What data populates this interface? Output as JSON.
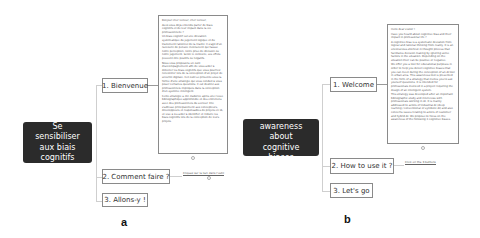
{
  "panels": [
    {
      "id": "a",
      "caption": "a",
      "root": {
        "lines": [
          "Se sensibiliser",
          "aux biais",
          "cognitifs"
        ]
      },
      "topics": [
        {
          "label": "1. Bienvenue"
        },
        {
          "label": "2. Comment faire ?"
        },
        {
          "label": "3. Allons-y !"
        }
      ],
      "note": {
        "paragraphs": [
          "Bonjour cher lecteur, cher lecteur,",
          "Avez-vous déjà entendu parler de biais cognitifs et de leur impact dans la vie professionnelle ?",
          "Un biais cognitif est une déviation systématique du jugement logique et du traitement rationnel de la réalité. Il s'agit d'un raccourci de pensée inconscient qui fausse notre perception, notre prise de décision ou notre jugement. Selon le contexte, ses effets peuvent être positifs ou négatifs.",
          "Nous vous proposons un outil d'accompagnement afin de vous aider à détecter les biais cognitifs que vous pourriez rencontrer lors de la conception d'un projet de sécurité digitale. Cet outil se présente sous la forme d'une stratégie qui vous conduit à vous poser certaines questions. Il est destiné aux professionnels impliqués dans la conception d'un système intelligent.",
          "Cette stratégie a été élaborée après une revue bibliographique approfondie et des entretiens avec des professionnels du secteur. Elle s'adresse principalement aux concepteurs, développeurs et responsables de projets en IA, et vise à les aider à identifier et réduire les biais cognitifs lors de la conception de leurs projets."
        ]
      },
      "link_label": "Cliquez sur le lien dans l'outil"
    },
    {
      "id": "b",
      "caption": "b",
      "root": {
        "lines": [
          "To raise awareness",
          "about cognitive",
          "biases"
        ]
      },
      "topics": [
        {
          "label": "1. Welcome"
        },
        {
          "label": "2. How to use it ?"
        },
        {
          "label": "3. Let's go"
        }
      ],
      "note": {
        "paragraphs": [
          "Hello dear visitor !",
          "Have you heard about cognitive bias and their impact in professional life ?",
          "A cognitive bias is a systematic deviation from logical and rational thinking from reality. It is an unconscious shortcut in thought process that facilitates decision making by ignoring some factors in the situation. Depending on the situation their can be positive or negative.",
          "We offer you a tool for educational purposes in order to help you detect cognitive biases that you can meet during the conception of an AI tool in urban area. This awareness tool is presented in the form of a strategy that invites you to ask yourself questions. It is intended for professionals involved in a project requiring the design of an intelligent system.",
          "This strategy was developed after an important bibliographic study and interviews with professionals working in AI. It is mainly addressed to actors of industrial AI (deep learning / conventional or symbolic AI) and also concerns issues relating to actors of customer and hybrid AI. We propose to focus on the awareness of the following 3 cognitive biases."
        ]
      },
      "link_label": "Click on the 3 buttons"
    }
  ]
}
